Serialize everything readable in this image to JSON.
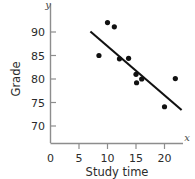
{
  "chart_data": {
    "type": "scatter",
    "title": "",
    "subtitle": "",
    "xlabel": "Study time",
    "ylabel": "Grade",
    "x_axis_variable": "x",
    "y_axis_variable": "y",
    "xlim": [
      0,
      23.5
    ],
    "ylim": [
      66.5,
      93.5
    ],
    "xticks": [
      0,
      5,
      10,
      15,
      20
    ],
    "xtick_labels": [
      "0",
      "5",
      "10",
      "15",
      "20"
    ],
    "yticks": [
      70,
      75,
      80,
      85,
      90
    ],
    "ytick_labels": [
      "70",
      "75",
      "80",
      "85",
      "90"
    ],
    "grid": false,
    "legend": null,
    "legend_position": "none",
    "point_color": "#111111",
    "line_color": "#111111",
    "axis_color": "#8d8d8d",
    "x": [
      8.5,
      10.0,
      11.2,
      12.1,
      13.7,
      15.0,
      15.1,
      16.0,
      20.0,
      21.9
    ],
    "y": [
      85.0,
      92.0,
      91.1,
      84.3,
      84.4,
      81.0,
      79.2,
      80.0,
      74.1,
      80.1
    ],
    "points": [
      {
        "x": 8.5,
        "y": 85.0
      },
      {
        "x": 10.0,
        "y": 92.0
      },
      {
        "x": 11.2,
        "y": 91.1
      },
      {
        "x": 12.1,
        "y": 84.3
      },
      {
        "x": 13.7,
        "y": 84.4
      },
      {
        "x": 15.0,
        "y": 81.0
      },
      {
        "x": 15.1,
        "y": 79.2
      },
      {
        "x": 16.0,
        "y": 80.0
      },
      {
        "x": 20.0,
        "y": 74.1
      },
      {
        "x": 21.9,
        "y": 80.1
      }
    ],
    "trend_line": {
      "type": "line",
      "name": "regression-line",
      "x_start": 7.0,
      "y_start": 90.1,
      "x_end": 23.0,
      "y_end": 73.4
    },
    "annotations": []
  }
}
